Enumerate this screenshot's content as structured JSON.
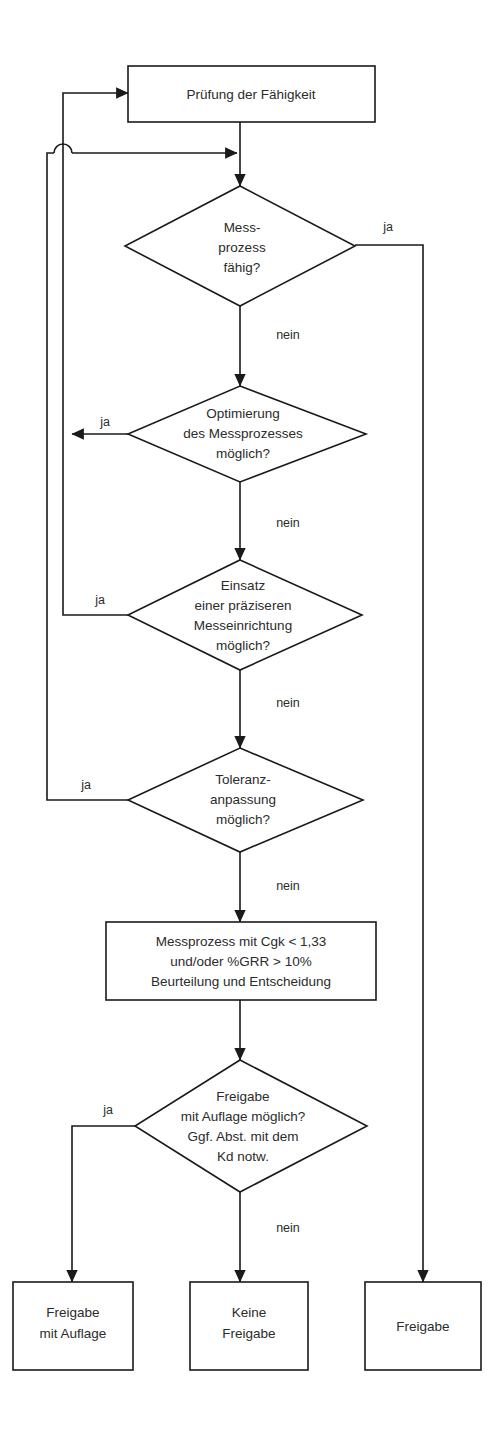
{
  "diagram": {
    "type": "flowchart",
    "orientation": "top-to-bottom",
    "colors": {
      "stroke": "#1a1a1a",
      "fill": "#ffffff",
      "text": "#2b2b2b",
      "background": "#ffffff"
    },
    "nodes": {
      "start_process": {
        "shape": "rectangle",
        "lines": [
          "Prüfung der Fähigkeit"
        ],
        "line1": "Prüfung der Fähigkeit"
      },
      "decision_capable": {
        "shape": "diamond",
        "lines": [
          "Mess-",
          "prozess",
          "fähig?"
        ],
        "line1": "Mess-",
        "line2": "prozess",
        "line3": "fähig?"
      },
      "decision_optimize": {
        "shape": "diamond",
        "lines": [
          "Optimierung",
          "des Messprozesses",
          "möglich?"
        ],
        "line1": "Optimierung",
        "line2": "des Messprozesses",
        "line3": "möglich?"
      },
      "decision_precise_device": {
        "shape": "diamond",
        "lines": [
          "Einsatz",
          "einer präziseren",
          "Messeinrichtung",
          "möglich?"
        ],
        "line1": "Einsatz",
        "line2": "einer präziseren",
        "line3": "Messeinrichtung",
        "line4": "möglich?"
      },
      "decision_tolerance": {
        "shape": "diamond",
        "lines": [
          "Toleranz-",
          "anpassung",
          "möglich?"
        ],
        "line1": "Toleranz-",
        "line2": "anpassung",
        "line3": "möglich?"
      },
      "process_evaluation": {
        "shape": "rectangle",
        "lines": [
          "Messprozess mit Cgk < 1,33",
          "und/oder %GRR > 10%",
          "Beurteilung und Entscheidung"
        ],
        "line1": "Messprozess mit Cgk < 1,33",
        "line2": "und/oder %GRR > 10%",
        "line3": "Beurteilung und Entscheidung"
      },
      "decision_conditional_release": {
        "shape": "diamond",
        "lines": [
          "Freigabe",
          "mit Auflage möglich?",
          "Ggf. Abst. mit dem",
          "Kd notw."
        ],
        "line1": "Freigabe",
        "line2": "mit Auflage möglich?",
        "line3": "Ggf. Abst. mit dem",
        "line4": "Kd notw."
      },
      "terminal_release_conditional": {
        "shape": "rectangle",
        "lines": [
          "Freigabe",
          "mit Auflage"
        ],
        "line1": "Freigabe",
        "line2": "mit Auflage"
      },
      "terminal_no_release": {
        "shape": "rectangle",
        "lines": [
          "Keine",
          "Freigabe"
        ],
        "line1": "Keine",
        "line2": "Freigabe"
      },
      "terminal_release": {
        "shape": "rectangle",
        "lines": [
          "Freigabe"
        ],
        "line1": "Freigabe"
      }
    },
    "edge_labels": {
      "capable_yes": "ja",
      "capable_no": "nein",
      "optimize_yes": "ja",
      "optimize_no": "nein",
      "precise_yes": "ja",
      "precise_no": "nein",
      "tolerance_yes": "ja",
      "tolerance_no": "nein",
      "conditional_yes": "ja",
      "conditional_no": "nein"
    },
    "edges": [
      {
        "from": "start_process",
        "to": "decision_capable",
        "label": ""
      },
      {
        "from": "decision_capable",
        "to": "terminal_release",
        "label": "ja"
      },
      {
        "from": "decision_capable",
        "to": "decision_optimize",
        "label": "nein"
      },
      {
        "from": "decision_optimize",
        "to": "start_process",
        "label": "ja"
      },
      {
        "from": "decision_optimize",
        "to": "decision_precise_device",
        "label": "nein"
      },
      {
        "from": "decision_precise_device",
        "to": "start_process",
        "label": "ja"
      },
      {
        "from": "decision_precise_device",
        "to": "decision_tolerance",
        "label": "nein"
      },
      {
        "from": "decision_tolerance",
        "to": "decision_capable",
        "label": "ja"
      },
      {
        "from": "decision_tolerance",
        "to": "process_evaluation",
        "label": "nein"
      },
      {
        "from": "process_evaluation",
        "to": "decision_conditional_release",
        "label": ""
      },
      {
        "from": "decision_conditional_release",
        "to": "terminal_release_conditional",
        "label": "ja"
      },
      {
        "from": "decision_conditional_release",
        "to": "terminal_no_release",
        "label": "nein"
      }
    ]
  }
}
